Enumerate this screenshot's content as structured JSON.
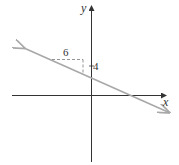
{
  "diagram": {
    "title": "",
    "axes": {
      "x_label": "x",
      "y_label": "y"
    },
    "line": {
      "description": "line with negative slope crossing y-axis above origin and x-axis right of origin",
      "color": "#a8a8a8",
      "arrows": "both ends"
    },
    "slope_triangle": {
      "run_label": "6",
      "rise_label": "4",
      "style": "dashed"
    },
    "y_intercept_tick_label": "4",
    "colors": {
      "axis": "#333333",
      "line": "#a8a8a8",
      "dashed": "#888888",
      "text": "#333333"
    }
  }
}
